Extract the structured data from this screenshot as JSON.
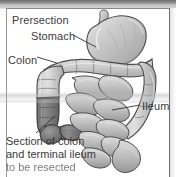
{
  "figure": {
    "panel_label": "Prersection",
    "labels": {
      "prersection": "Prersection",
      "stomach": "Stomach",
      "colon": "Colon",
      "ileum": "Ileum"
    },
    "caption": {
      "line1": "Section of colon",
      "line2": "and terminal ileum",
      "line3": "to be resected"
    },
    "icons": {
      "leader_line": "leader-line-icon",
      "resection_marker": "resection-marker-icon"
    },
    "colors": {
      "background": "#ffffff",
      "text": "#3b3b3b",
      "border": "#6d6d6d",
      "organ_fill_light": "#d8d8d8",
      "organ_fill_mid": "#b4b4b4",
      "organ_outline": "#4a4a4a",
      "resected_fill_dark": "#7d7d7d",
      "top_band": "#6e6e6e"
    },
    "anatomy_parts": [
      "stomach",
      "transverse-colon",
      "ascending-colon",
      "descending-colon",
      "sigmoid-colon",
      "cecum",
      "terminal-ileum",
      "small-bowel-loops"
    ]
  }
}
